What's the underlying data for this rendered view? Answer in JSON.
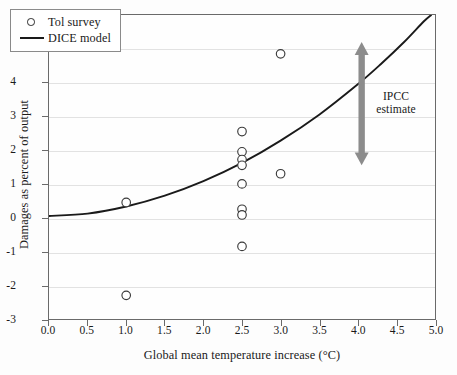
{
  "chart_data": {
    "type": "scatter",
    "title": "",
    "xlabel": "Global mean temperature increase (°C)",
    "ylabel": "Damages as percent of output",
    "xlim": [
      0.0,
      5.0
    ],
    "ylim": [
      -3,
      6
    ],
    "xticks": [
      "0.0",
      "0.5",
      "1.0",
      "1.5",
      "2.0",
      "2.5",
      "3.0",
      "3.5",
      "4.0",
      "4.5",
      "5.0"
    ],
    "xtick_values": [
      0.0,
      0.5,
      1.0,
      1.5,
      2.0,
      2.5,
      3.0,
      3.5,
      4.0,
      4.5,
      5.0
    ],
    "yticks": [
      "6",
      "5",
      "4",
      "3",
      "2",
      "1",
      "0",
      "-1",
      "-2",
      "-3"
    ],
    "ytick_values": [
      6,
      5,
      4,
      3,
      2,
      1,
      0,
      -1,
      -2,
      -3
    ],
    "grid": "horizontal",
    "legend_position": "top-left",
    "series": [
      {
        "name": "Tol survey",
        "type": "scatter",
        "marker": "open-circle",
        "points": [
          {
            "x": 1.0,
            "y": 0.45
          },
          {
            "x": 1.0,
            "y": -2.3
          },
          {
            "x": 2.5,
            "y": 2.55
          },
          {
            "x": 2.5,
            "y": 1.95
          },
          {
            "x": 2.5,
            "y": 1.72
          },
          {
            "x": 2.5,
            "y": 1.55
          },
          {
            "x": 2.5,
            "y": 1.0
          },
          {
            "x": 2.5,
            "y": 0.25
          },
          {
            "x": 2.5,
            "y": 0.08
          },
          {
            "x": 2.5,
            "y": -0.85
          },
          {
            "x": 3.0,
            "y": 4.85
          },
          {
            "x": 3.0,
            "y": 1.3
          }
        ]
      },
      {
        "name": "DICE model",
        "type": "line",
        "description": "quadratic damage curve rising from 0 at 0°C to about 6 at 4.6°C",
        "curve_points": [
          {
            "x": 0.0,
            "y": 0.05
          },
          {
            "x": 0.5,
            "y": 0.12
          },
          {
            "x": 1.0,
            "y": 0.33
          },
          {
            "x": 1.5,
            "y": 0.65
          },
          {
            "x": 2.0,
            "y": 1.08
          },
          {
            "x": 2.5,
            "y": 1.62
          },
          {
            "x": 3.0,
            "y": 2.28
          },
          {
            "x": 3.5,
            "y": 3.05
          },
          {
            "x": 4.0,
            "y": 3.95
          },
          {
            "x": 4.3,
            "y": 4.55
          },
          {
            "x": 4.6,
            "y": 5.2
          },
          {
            "x": 4.85,
            "y": 5.8
          },
          {
            "x": 4.95,
            "y": 6.0
          }
        ]
      }
    ],
    "annotations": [
      {
        "name": "ipcc-estimate",
        "text_line1": "IPCC",
        "text_line2": "estimate",
        "type": "double-headed-arrow",
        "x": 4.05,
        "y_top": 5.2,
        "y_bottom": 1.55,
        "color": "#8c8c8c"
      }
    ]
  },
  "legend": {
    "items": [
      {
        "label": "Tol survey",
        "marker": "open-circle"
      },
      {
        "label": "DICE model",
        "marker": "line"
      }
    ]
  },
  "colors": {
    "curve": "#1a1a1a",
    "marker_stroke": "#3a3a3a",
    "gridline": "#e2e2e2",
    "axis": "#6a6a6a",
    "arrow": "#8c8c8c",
    "background": "#fdfdfd"
  }
}
